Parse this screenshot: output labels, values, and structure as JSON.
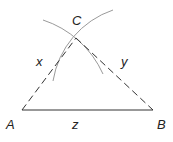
{
  "diagram": {
    "type": "geometric-construction",
    "points": {
      "A": {
        "label": "A",
        "x": 22,
        "y": 110
      },
      "B": {
        "label": "B",
        "x": 153,
        "y": 110
      },
      "C": {
        "label": "C",
        "x": 76,
        "y": 38
      }
    },
    "sides": {
      "x": {
        "label": "x",
        "from": "A",
        "to": "C",
        "style": "dashed"
      },
      "y": {
        "label": "y",
        "from": "C",
        "to": "B",
        "style": "dashed"
      },
      "z": {
        "label": "z",
        "from": "A",
        "to": "B",
        "style": "solid"
      }
    },
    "arcs": [
      {
        "center": "A",
        "through": "C",
        "color": "#999999"
      },
      {
        "center": "B",
        "through": "C",
        "color": "#999999"
      }
    ],
    "colors": {
      "line": "#333333",
      "arc": "#9a9a9a"
    }
  }
}
